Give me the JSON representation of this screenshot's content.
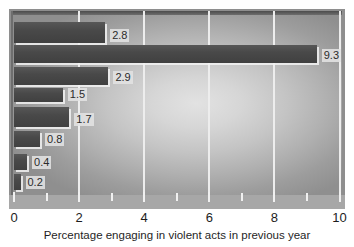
{
  "chart_data": {
    "type": "bar",
    "orientation": "horizontal",
    "title": "",
    "subtitle": "",
    "xlabel": "Percentage engaging in violent acts in previous year",
    "ylabel": "",
    "xlim": [
      0,
      10
    ],
    "x_major_ticks": [
      0,
      2,
      4,
      6,
      8,
      10
    ],
    "x_major_tick_labels": [
      "0",
      "2",
      "4",
      "6",
      "8",
      "10"
    ],
    "x_minor_ticks": [
      1,
      3,
      5,
      7,
      9
    ],
    "grid": true,
    "grid_axis": "x",
    "legend": false,
    "categories": [
      "",
      "",
      "",
      "",
      "",
      "",
      "",
      ""
    ],
    "values": [
      2.8,
      9.3,
      2.9,
      1.5,
      1.7,
      0.8,
      0.4,
      0.2
    ],
    "data_labels": [
      "2.8",
      "9.3",
      "2.9",
      "1.5",
      "1.7",
      "0.8",
      "0.4",
      "0.2"
    ],
    "bars": [
      {
        "label": "2.8",
        "value": 2.8,
        "top": 22,
        "height": 21
      },
      {
        "label": "9.3",
        "value": 9.3,
        "top": 45,
        "height": 18
      },
      {
        "label": "2.9",
        "value": 2.9,
        "top": 67,
        "height": 18
      },
      {
        "label": "1.5",
        "value": 1.5,
        "top": 88,
        "height": 14
      },
      {
        "label": "1.7",
        "value": 1.7,
        "top": 107,
        "height": 20
      },
      {
        "label": "0.8",
        "value": 0.8,
        "top": 131,
        "height": 16
      },
      {
        "label": "0.4",
        "value": 0.4,
        "top": 154,
        "height": 16
      },
      {
        "label": "0.2",
        "value": 0.2,
        "top": 174,
        "height": 16
      }
    ]
  },
  "colors": {
    "bar_fill": "#494949",
    "plot_background_center": "#e2e2e2",
    "plot_background_edge": "#8f8f8f",
    "gridline": "#ededed",
    "axis_band": "#a7a7a7",
    "text": "#1d1d1d",
    "page_background": "#ffffff"
  },
  "icons": {}
}
